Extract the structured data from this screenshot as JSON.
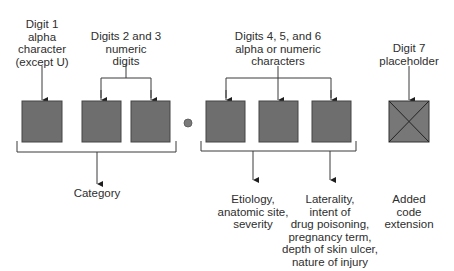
{
  "diagram": {
    "colors": {
      "box_fill": "#6e6e6e",
      "box_stroke": "#444444",
      "line": "#3a3a3a",
      "text": "#2e2e2e",
      "background": "#ffffff"
    },
    "top_labels": [
      {
        "id": "digit1",
        "text": "Digit 1\nalpha\ncharacter\n(except U)"
      },
      {
        "id": "digits23",
        "text": "Digits 2 and 3\nnumeric\ndigits"
      },
      {
        "id": "digits456",
        "text": "Digits 4, 5, and 6\nalpha or numeric\ncharacters"
      },
      {
        "id": "digit7",
        "text": "Digit 7\nplaceholder"
      }
    ],
    "boxes": [
      {
        "digit": 1,
        "type": "filled"
      },
      {
        "digit": 2,
        "type": "filled"
      },
      {
        "digit": 3,
        "type": "filled"
      },
      {
        "separator": "decimal-point"
      },
      {
        "digit": 4,
        "type": "filled"
      },
      {
        "digit": 5,
        "type": "filled"
      },
      {
        "digit": 6,
        "type": "filled"
      },
      {
        "digit": 7,
        "type": "crossed"
      }
    ],
    "bottom_labels": [
      {
        "id": "category",
        "text": "Category"
      },
      {
        "id": "etiology",
        "text": "Etiology,\nanatomic site,\nseverity"
      },
      {
        "id": "laterality",
        "text": "Laterality,\nintent of\ndrug poisoning,\npregnancy term,\ndepth of skin ulcer,\nnature of injury"
      },
      {
        "id": "extension",
        "text": "Added\ncode\nextension"
      }
    ]
  }
}
